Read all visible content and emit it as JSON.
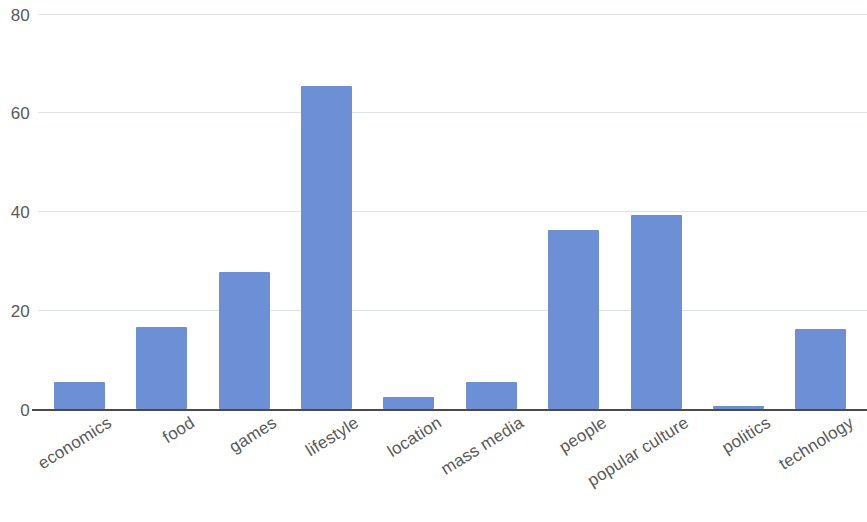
{
  "chart_data": {
    "type": "bar",
    "title": "",
    "subtitle": "",
    "xlabel": "",
    "ylabel": "",
    "categories": [
      "economics",
      "food",
      "games",
      "lifestyle",
      "location",
      "mass media",
      "people",
      "popular culture",
      "politics",
      "technology"
    ],
    "values": [
      5.5,
      16.7,
      27.7,
      65.5,
      2.5,
      5.5,
      36.2,
      39.3,
      0.7,
      16.2
    ],
    "ylim": [
      0,
      80
    ],
    "y_ticks": [
      0,
      20,
      40,
      60,
      80
    ],
    "y_tick_labels": [
      "0",
      "20",
      "40",
      "60",
      "80"
    ],
    "grid": true,
    "grid_axis": "y",
    "legend": false,
    "legend_position": "none",
    "bar_color": "#6d8fd6",
    "gridline_color": "#dfe3e8",
    "axis_color": "#4a4a4a",
    "tick_label_color": "#595959",
    "xtick_label_rotation": -32,
    "background_color": "#ffffff"
  },
  "axis": {
    "y_tick_80": "80",
    "y_tick_60": "60",
    "y_tick_40": "40",
    "y_tick_20": "20",
    "y_tick_0": "0"
  }
}
